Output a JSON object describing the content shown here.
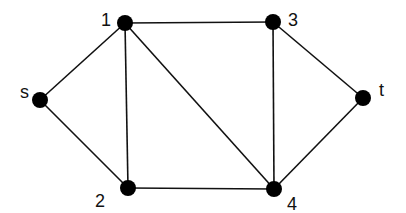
{
  "graph": {
    "type": "undirected",
    "node_color": "#000000",
    "edge_color": "#111111",
    "node_radius": 8,
    "nodes": [
      {
        "id": "s",
        "label": "s",
        "x": 40,
        "y": 100,
        "lx": 20,
        "ly": 98
      },
      {
        "id": "1",
        "label": "1",
        "x": 125,
        "y": 23,
        "lx": 101,
        "ly": 26
      },
      {
        "id": "2",
        "label": "2",
        "x": 128,
        "y": 188,
        "lx": 95,
        "ly": 207
      },
      {
        "id": "3",
        "label": "3",
        "x": 273,
        "y": 22,
        "lx": 288,
        "ly": 26
      },
      {
        "id": "4",
        "label": "4",
        "x": 274,
        "y": 189,
        "lx": 287,
        "ly": 210
      },
      {
        "id": "t",
        "label": "t",
        "x": 363,
        "y": 98,
        "lx": 379,
        "ly": 96
      }
    ],
    "edges": [
      {
        "from": "s",
        "to": "1"
      },
      {
        "from": "s",
        "to": "2"
      },
      {
        "from": "1",
        "to": "2"
      },
      {
        "from": "1",
        "to": "3"
      },
      {
        "from": "1",
        "to": "4"
      },
      {
        "from": "3",
        "to": "4"
      },
      {
        "from": "3",
        "to": "t"
      },
      {
        "from": "2",
        "to": "4"
      },
      {
        "from": "4",
        "to": "t"
      }
    ]
  }
}
